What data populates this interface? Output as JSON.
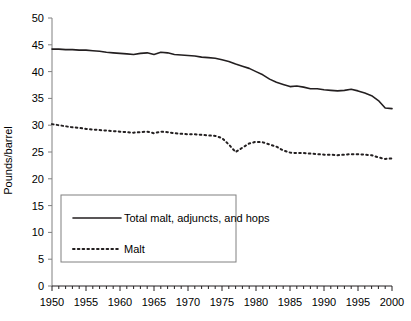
{
  "chart_data": {
    "type": "line",
    "title": "",
    "xlabel": "",
    "ylabel": "Pounds/barrel",
    "xlim": [
      1950,
      2000
    ],
    "ylim": [
      0,
      50
    ],
    "ytick_step": 5,
    "xtick_step": 5,
    "xminor_step": 1,
    "grid": false,
    "legend_position": "lower-left-inside",
    "yticks": [
      "0",
      "5",
      "10",
      "15",
      "20",
      "25",
      "30",
      "35",
      "40",
      "45",
      "50"
    ],
    "xticks": [
      "1950",
      "1955",
      "1960",
      "1965",
      "1970",
      "1975",
      "1980",
      "1985",
      "1990",
      "1995",
      "2000"
    ],
    "x": [
      1950,
      1951,
      1952,
      1953,
      1954,
      1955,
      1956,
      1957,
      1958,
      1959,
      1960,
      1961,
      1962,
      1963,
      1964,
      1965,
      1966,
      1967,
      1968,
      1969,
      1970,
      1971,
      1972,
      1973,
      1974,
      1975,
      1976,
      1977,
      1978,
      1979,
      1980,
      1981,
      1982,
      1983,
      1984,
      1985,
      1986,
      1987,
      1988,
      1989,
      1990,
      1991,
      1992,
      1993,
      1994,
      1995,
      1996,
      1997,
      1998,
      1999,
      2000
    ],
    "series": [
      {
        "name": "Total malt, adjuncts, and hops",
        "style": "solid",
        "color": "#231f20",
        "values": [
          44.2,
          44.2,
          44.1,
          44.1,
          44.0,
          44.0,
          43.9,
          43.8,
          43.6,
          43.5,
          43.4,
          43.3,
          43.2,
          43.4,
          43.5,
          43.2,
          43.6,
          43.5,
          43.2,
          43.1,
          43.0,
          42.9,
          42.7,
          42.6,
          42.5,
          42.2,
          41.9,
          41.4,
          41.0,
          40.6,
          40.0,
          39.4,
          38.6,
          38.0,
          37.6,
          37.2,
          37.3,
          37.1,
          36.8,
          36.8,
          36.6,
          36.5,
          36.4,
          36.5,
          36.7,
          36.4,
          36.0,
          35.5,
          34.6,
          33.2,
          33.1
        ]
      },
      {
        "name": "Malt",
        "style": "dotted",
        "color": "#231f20",
        "values": [
          30.2,
          30.0,
          29.8,
          29.6,
          29.5,
          29.3,
          29.2,
          29.1,
          29.0,
          28.9,
          28.8,
          28.7,
          28.6,
          28.7,
          28.8,
          28.5,
          28.8,
          28.7,
          28.5,
          28.4,
          28.3,
          28.3,
          28.2,
          28.1,
          28.0,
          27.6,
          26.4,
          25.0,
          25.8,
          26.6,
          26.9,
          26.8,
          26.4,
          26.0,
          25.3,
          24.9,
          24.8,
          24.8,
          24.7,
          24.6,
          24.5,
          24.5,
          24.4,
          24.5,
          24.6,
          24.6,
          24.5,
          24.4,
          24.0,
          23.7,
          23.8
        ]
      }
    ]
  },
  "legend": {
    "items": [
      {
        "label": "Total malt, adjuncts, and hops",
        "style": "solid"
      },
      {
        "label": "Malt",
        "style": "dotted"
      }
    ]
  },
  "axes": {
    "ylabel": "Pounds/barrel"
  }
}
